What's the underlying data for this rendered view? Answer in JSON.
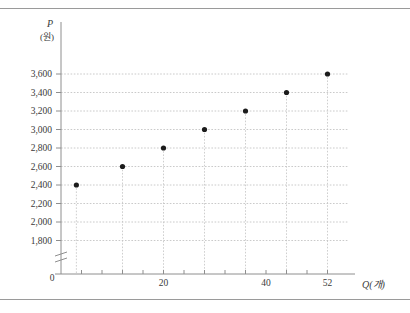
{
  "figure": {
    "has_top_rule": true,
    "has_bottom_rule": true,
    "background_color": "#ffffff"
  },
  "axes": {
    "y_axis_label": "P",
    "y_axis_unit": "(원)",
    "x_axis_label": "Q",
    "x_axis_unit": "(개)",
    "x_axis_label_full": "Q(개)",
    "origin_label": "0",
    "y_axis_broken": true
  },
  "chart_data": {
    "type": "scatter",
    "title": "",
    "xlabel": "Q(개)",
    "ylabel": "P(원)",
    "x": [
      3,
      12,
      20,
      28,
      36,
      44,
      52
    ],
    "values": [
      2400,
      2600,
      2800,
      3000,
      3200,
      3400,
      3600
    ],
    "points": [
      {
        "x": 3,
        "y": 2400
      },
      {
        "x": 12,
        "y": 2600
      },
      {
        "x": 20,
        "y": 2800
      },
      {
        "x": 28,
        "y": 3000
      },
      {
        "x": 36,
        "y": 3200
      },
      {
        "x": 44,
        "y": 3400
      },
      {
        "x": 52,
        "y": 3600
      }
    ],
    "xlim": [
      0,
      56
    ],
    "ylim": [
      1700,
      3700
    ],
    "x_ticks": [
      4,
      8,
      12,
      16,
      20,
      24,
      28,
      32,
      36,
      40,
      44,
      48,
      52
    ],
    "x_tick_labels": [
      "",
      "",
      "",
      "",
      "20",
      "",
      "",
      "",
      "",
      "40",
      "",
      "",
      "52"
    ],
    "x_labeled_ticks": [
      {
        "value": 20,
        "label": "20"
      },
      {
        "value": 40,
        "label": "40"
      },
      {
        "value": 52,
        "label": "52"
      }
    ],
    "y_ticks": [
      1800,
      2000,
      2200,
      2400,
      2600,
      2800,
      3000,
      3200,
      3400,
      3600
    ],
    "y_tick_labels": [
      "1,800",
      "2,000",
      "2,200",
      "2,400",
      "2,600",
      "2,800",
      "3,000",
      "3,200",
      "3,400",
      "3,600"
    ],
    "grid": true,
    "grid_style": "dotted-horizontal-and-droplines",
    "legend": "none",
    "marker_color": "#1c1c1c",
    "grid_color": "#bdbdbd"
  }
}
